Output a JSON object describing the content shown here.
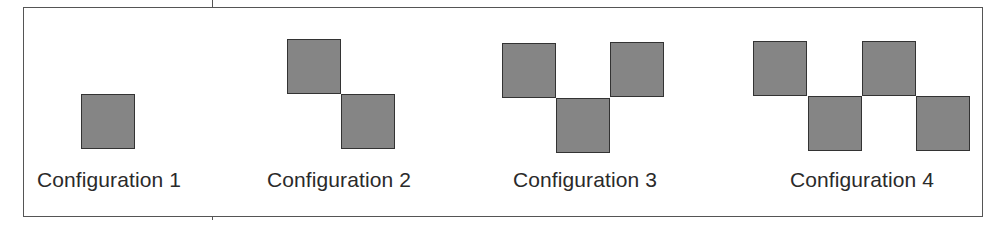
{
  "figure": {
    "configurations": [
      {
        "label": "Configuration 1",
        "squares": [
          [
            0,
            1
          ]
        ]
      },
      {
        "label": "Configuration 2",
        "squares": [
          [
            0,
            0
          ],
          [
            1,
            1
          ]
        ]
      },
      {
        "label": "Configuration 3",
        "squares": [
          [
            0,
            0
          ],
          [
            1,
            1
          ],
          [
            2,
            0
          ]
        ]
      },
      {
        "label": "Configuration 4",
        "squares": [
          [
            0,
            0
          ],
          [
            1,
            1
          ],
          [
            2,
            0
          ],
          [
            3,
            1
          ]
        ]
      }
    ],
    "colors": {
      "square_fill": "#858585",
      "square_border": "#333333",
      "frame": "#555555",
      "text": "#2a2a2a"
    }
  }
}
